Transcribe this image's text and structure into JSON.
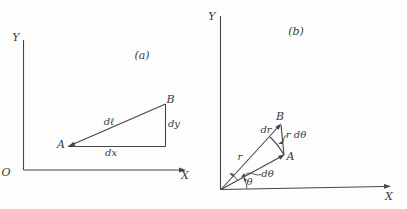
{
  "colors": {
    "ink": "#454545",
    "bg": "#fdfdfd"
  },
  "panel_a": {
    "tag": "(a)",
    "axis": {
      "y": "Y",
      "x": "X",
      "origin": "O"
    },
    "points": {
      "a": "A",
      "b": "B"
    },
    "segments": {
      "hypotenuse": "dℓ",
      "horizontal": "dx",
      "vertical": "dy"
    }
  },
  "panel_b": {
    "tag": "(b)",
    "axis": {
      "y": "Y",
      "x": "X"
    },
    "points": {
      "a": "A",
      "b": "B"
    },
    "labels": {
      "radius": "r",
      "dr": "dr",
      "arc_length": "r dθ",
      "dtheta": "dθ",
      "theta": "θ"
    }
  }
}
